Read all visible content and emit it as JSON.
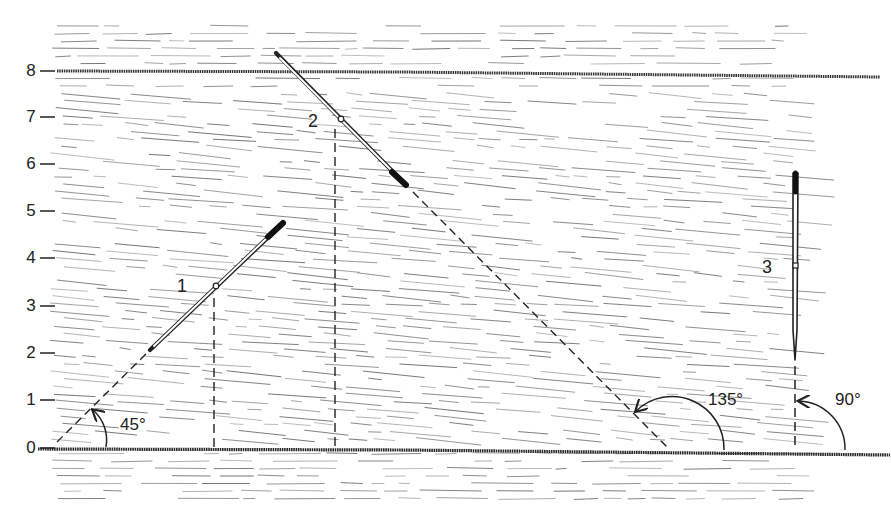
{
  "figure": {
    "type": "illustration",
    "colors": {
      "ink": "#222222",
      "grain": "#6e6e6e",
      "background": "#ffffff"
    }
  },
  "axis": {
    "ticks": [
      {
        "label": "0",
        "y": 448
      },
      {
        "label": "1",
        "y": 400
      },
      {
        "label": "2",
        "y": 353
      },
      {
        "label": "3",
        "y": 306
      },
      {
        "label": "4",
        "y": 258
      },
      {
        "label": "5",
        "y": 211
      },
      {
        "label": "6",
        "y": 164
      },
      {
        "label": "7",
        "y": 117
      },
      {
        "label": "8",
        "y": 71
      }
    ]
  },
  "needles": [
    {
      "id": "1",
      "label": "1",
      "angle_label": "45°"
    },
    {
      "id": "2",
      "label": "2",
      "angle_label": "135°"
    },
    {
      "id": "3",
      "label": "3",
      "angle_label": "90°"
    }
  ]
}
